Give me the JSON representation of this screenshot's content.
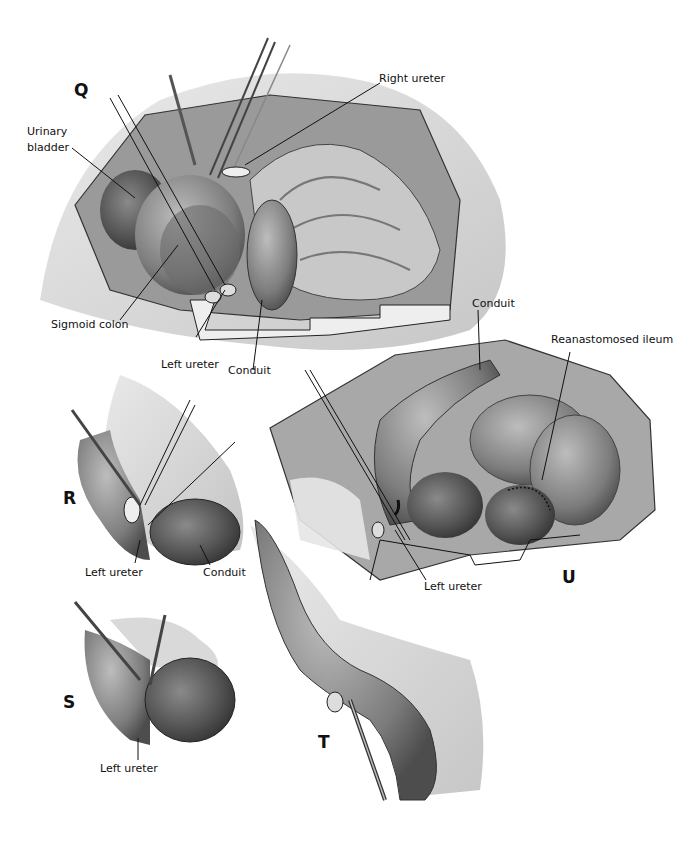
{
  "figure": {
    "panels": [
      {
        "id": "Q",
        "letter": "Q",
        "labels": {
          "urinary_bladder": "Urinary bladder",
          "urinary_line1": "Urinary",
          "urinary_line2": "bladder",
          "right_ureter": "Right ureter",
          "sigmoid_colon": "Sigmoid colon",
          "left_ureter": "Left ureter",
          "conduit": "Conduit"
        }
      },
      {
        "id": "R",
        "letter": "R",
        "labels": {
          "left_ureter": "Left ureter",
          "conduit": "Conduit"
        }
      },
      {
        "id": "S",
        "letter": "S",
        "labels": {
          "left_ureter": "Left ureter"
        }
      },
      {
        "id": "T",
        "letter": "T",
        "labels": {}
      },
      {
        "id": "U",
        "letter": "U",
        "labels": {
          "conduit": "Conduit",
          "reanastomosed_ileum": "Reanastomosed ileum",
          "left_ureter": "Left ureter"
        }
      }
    ],
    "colors": {
      "ink": "#111111",
      "dark_tissue": "#4a4a4a",
      "mid_tissue": "#7a7a7a",
      "light_tissue": "#b5b5b5",
      "wash": "#d9d9d9",
      "background": "#ffffff"
    }
  }
}
